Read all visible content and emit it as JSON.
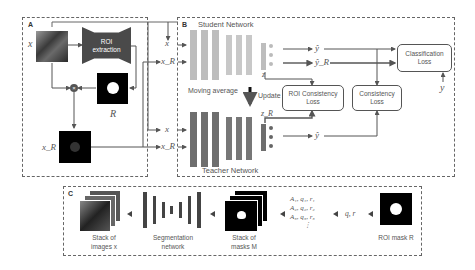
{
  "panels": {
    "A": {
      "label": "A",
      "roi_extraction": "ROI extraction",
      "input": "x",
      "mask": "R",
      "masked_input": "x_R",
      "multiply_symbol": "×"
    },
    "B": {
      "label": "B",
      "student_title": "Student Network",
      "teacher_title": "Teacher Network",
      "moving_average": "Moving average",
      "update": "Update",
      "inputs": {
        "x": "x",
        "xR": "x_R"
      },
      "student_feature": "z",
      "teacher_feature": "z_R",
      "outputs": {
        "y_hat": "ŷ",
        "y_hat_R": "ŷ_R",
        "teacher_y_hat": "ŷ"
      },
      "losses": {
        "classification": "Classification Loss",
        "roi_consistency": "ROI Consistency Loss",
        "consistency": "Consistency Loss"
      },
      "label_y": "y"
    },
    "C": {
      "label": "C",
      "stack_images": "Stack of images x",
      "segmentation_network": "Segmentation network",
      "stack_masks": "Stack of masks M",
      "params": [
        "A₁, q₁, r₁",
        "A₂, q₂, r₂",
        "A₃, q₃, r₃",
        "⋮"
      ],
      "qr": "q, r",
      "roi_mask": "ROI mask R"
    }
  },
  "colors": {
    "student_bar": "#bdbdbd",
    "teacher_bar": "#6e6e6e",
    "roi_box": "#4a4a4a",
    "arrow": "#555555"
  }
}
